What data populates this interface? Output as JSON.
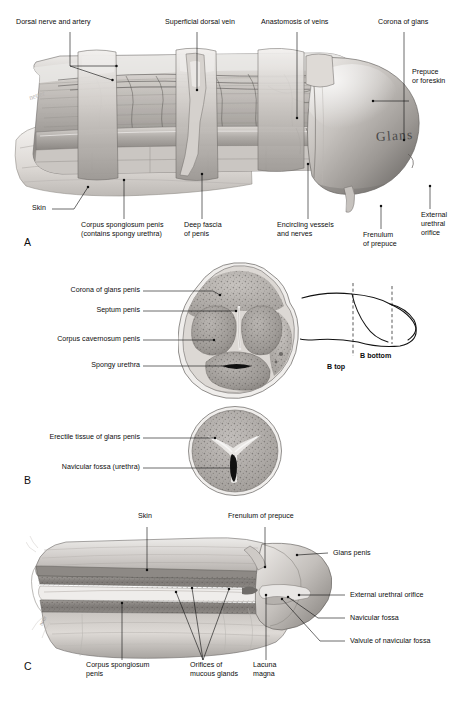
{
  "figure": {
    "panels": [
      "A",
      "B",
      "C"
    ]
  },
  "panelA": {
    "id": "A",
    "inline_text": "Glans",
    "labels": [
      {
        "key": "dorsal_nerve_artery",
        "text": "Dorsal nerve and artery"
      },
      {
        "key": "superficial_dorsal_vein",
        "text": "Superficial dorsal vein"
      },
      {
        "key": "anastomosis_of_veins",
        "text": "Anastomosis of veins"
      },
      {
        "key": "corona_of_glans",
        "text": "Corona of glans"
      },
      {
        "key": "prepuce",
        "text": "Prepuce\nor foreskin"
      },
      {
        "key": "skin",
        "text": "Skin"
      },
      {
        "key": "corpus_spongiosum",
        "text": "Corpus spongiosum penis\n(contains spongy urethra)"
      },
      {
        "key": "deep_fascia",
        "text": "Deep fascia\nof penis"
      },
      {
        "key": "encircling_vessels",
        "text": "Encircling vessels\nand nerves"
      },
      {
        "key": "frenulum",
        "text": "Frenulum\nof prepuce"
      },
      {
        "key": "external_urethral_orifice",
        "text": "External\nurethral\norifice"
      }
    ]
  },
  "panelB": {
    "id": "B",
    "labels_upper": [
      {
        "key": "corona_of_glans_penis",
        "text": "Corona of glans penis"
      },
      {
        "key": "septum_penis",
        "text": "Septum penis"
      },
      {
        "key": "corpus_cavernosum_penis",
        "text": "Corpus cavernosum penis"
      },
      {
        "key": "spongy_urethra",
        "text": "Spongy urethra"
      }
    ],
    "labels_lower": [
      {
        "key": "erectile_tissue_glans",
        "text": "Erectile tissue of glans penis"
      },
      {
        "key": "navicular_fossa_urethra",
        "text": "Navicular fossa (urethra)"
      }
    ],
    "key_diagram": {
      "section_top": "B top",
      "section_bottom": "B bottom"
    }
  },
  "panelC": {
    "id": "C",
    "labels": [
      {
        "key": "skin",
        "text": "Skin"
      },
      {
        "key": "frenulum_of_prepuce",
        "text": "Frenulum of prepuce"
      },
      {
        "key": "glans_penis",
        "text": "Glans penis"
      },
      {
        "key": "external_urethral_orifice",
        "text": "External urethral orifice"
      },
      {
        "key": "navicular_fossa",
        "text": "Navicular fossa"
      },
      {
        "key": "valvule_navicular_fossa",
        "text": "Valvule of navicular fossa"
      },
      {
        "key": "corpus_spongiosum_penis",
        "text": "Corpus spongiosum\npenis"
      },
      {
        "key": "orifices_mucous_glands",
        "text": "Orifices of\nmucous glands"
      },
      {
        "key": "lacuna_magna",
        "text": "Lacuna\nmagna"
      }
    ]
  },
  "colors": {
    "ink": "#111111",
    "paper": "#ffffff",
    "tissue_light": "#d9d6d2",
    "tissue_mid": "#b3afab",
    "tissue_dark": "#7d7a77",
    "tissue_darker": "#55524f"
  }
}
